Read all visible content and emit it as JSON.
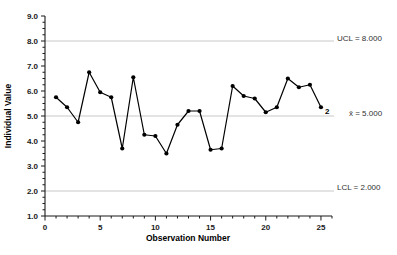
{
  "chart_data": {
    "type": "line",
    "title": "",
    "subtitle": "",
    "xlabel": "Observation Number",
    "ylabel": "Individual Value",
    "x": [
      1,
      2,
      3,
      4,
      5,
      6,
      7,
      8,
      9,
      10,
      11,
      12,
      13,
      14,
      15,
      16,
      17,
      18,
      19,
      20,
      21,
      22,
      23,
      24,
      25
    ],
    "values": [
      5.75,
      5.35,
      4.75,
      6.75,
      5.95,
      5.75,
      3.7,
      6.55,
      4.25,
      4.2,
      3.5,
      4.65,
      5.2,
      5.2,
      3.65,
      3.7,
      6.2,
      5.8,
      5.7,
      5.15,
      5.35,
      6.5,
      6.15,
      6.25,
      5.35
    ],
    "series": [
      {
        "name": "Individual Value",
        "values": [
          5.75,
          5.35,
          4.75,
          6.75,
          5.95,
          5.75,
          3.7,
          6.55,
          4.25,
          4.2,
          3.5,
          4.65,
          5.2,
          5.2,
          3.65,
          3.7,
          6.2,
          5.8,
          5.7,
          5.15,
          5.35,
          6.5,
          6.15,
          6.25,
          5.35
        ]
      }
    ],
    "xlim": [
      0,
      26
    ],
    "ylim": [
      1.0,
      9.0
    ],
    "xticks": [
      0,
      5,
      10,
      15,
      20,
      25
    ],
    "xtick_labels": [
      "0",
      "5",
      "10",
      "15",
      "20",
      "25"
    ],
    "yticks": [
      1.0,
      2.0,
      3.0,
      4.0,
      5.0,
      6.0,
      7.0,
      8.0,
      9.0
    ],
    "ytick_labels": [
      "1.0",
      "2.0",
      "3.0",
      "4.0",
      "5.0",
      "6.0",
      "7.0",
      "8.0",
      "9.0"
    ],
    "grid": false,
    "legend": "none",
    "marker": "filled-circle",
    "line_color": "#000000",
    "marker_color": "#000000",
    "limit_line_color": "#c8c8c8",
    "control_limits": [
      {
        "key": "ucl",
        "label": "UCL = 8.000",
        "value": 8.0
      },
      {
        "key": "center",
        "label": "x̄ = 5.000",
        "value": 5.0
      },
      {
        "key": "lcl",
        "label": "LCL = 2.000",
        "value": 2.0
      }
    ],
    "annotations": [
      {
        "label": "2",
        "x": 25,
        "y": 5.35,
        "meaning": "test-2-violation"
      }
    ]
  },
  "labels": {
    "ucl_text": "UCL = 8.000",
    "center_text": "x̄ = 5.000",
    "lcl_text": "LCL = 2.000",
    "violation_text": "2",
    "x_axis_title": "Observation Number",
    "y_axis_title": "Individual Value"
  }
}
